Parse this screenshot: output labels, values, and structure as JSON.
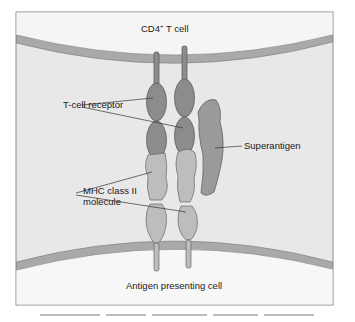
{
  "figure": {
    "top_cell_label": "CD4",
    "top_cell_superscript": "+",
    "top_cell_suffix": " T cell",
    "bottom_cell_label": "Antigen presenting cell",
    "labels": {
      "tcr": "T-cell receptor",
      "superantigen": "Superantigen",
      "mhc_line1": "MHC class II",
      "mhc_line2": "molecule"
    }
  },
  "colors": {
    "frame_border": "#8a8a8a",
    "cell_interior": "#f4f4f4",
    "gap_fill": "#e6e6e6",
    "membrane": "#a8a8a8",
    "tcr": "#8c8c8c",
    "mhc": "#bdbdbd",
    "superantigen": "#9a9a9a"
  }
}
